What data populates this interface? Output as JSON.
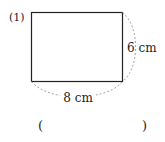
{
  "problem": {
    "number_label": "(1)",
    "shape": "rectangle",
    "width_label": "8 cm",
    "height_label": "6 cm",
    "answer_open": "(",
    "answer_close": ")"
  },
  "colors": {
    "stroke": "#222222",
    "dashed": "#999999",
    "text": "#222222"
  }
}
